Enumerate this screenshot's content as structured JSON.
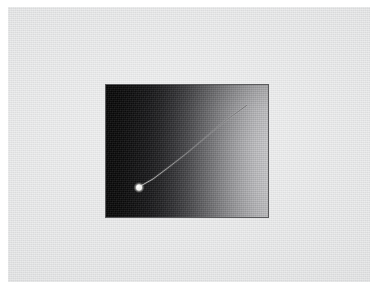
{
  "figure": {
    "kind": "scanned-photographic-plate",
    "background_color": "#ffffff",
    "mount_color": "#e2e3e4",
    "mount": {
      "x": 8,
      "y": 7,
      "width": 362,
      "height": 275
    },
    "caption": "",
    "label": ""
  },
  "plate": {
    "name": "dark gradient plate",
    "x": 105,
    "y": 84,
    "width": 164,
    "height": 134,
    "border_color": "#5a5a5c",
    "border_width": 1,
    "gradient": {
      "direction": "horizontal",
      "from_color": "#070707",
      "to_color": "#c9c9cb",
      "description": "density falls off left-to-right from near-black to light gray"
    },
    "vertical_shading": {
      "top_color": "rgba(0,0,0,0.16)",
      "bottom_color": "rgba(0,0,0,0.07)"
    }
  },
  "features": {
    "streak": {
      "name": "diagonal streak",
      "stroke_color": "#b9b9bb",
      "stroke_width": 0.85,
      "points": [
        {
          "x": 139.5,
          "y": 185.0
        },
        {
          "x": 152.0,
          "y": 178.0
        },
        {
          "x": 168.0,
          "y": 166.0
        },
        {
          "x": 186.0,
          "y": 152.0
        },
        {
          "x": 205.0,
          "y": 136.0
        },
        {
          "x": 224.0,
          "y": 120.0
        },
        {
          "x": 238.0,
          "y": 110.0
        },
        {
          "x": 245.5,
          "y": 104.5
        }
      ],
      "upper_endpoint": {
        "x": 245.5,
        "y": 104.5
      },
      "lower_endpoint": {
        "x": 139.5,
        "y": 185.0
      }
    },
    "bright_knot": {
      "name": "bright blob",
      "center": {
        "x": 138.0,
        "y": 186.5
      },
      "radius": 3.4,
      "core_color": "#f2f2f0",
      "halo_color": "rgba(220,220,218,0.45)"
    }
  }
}
